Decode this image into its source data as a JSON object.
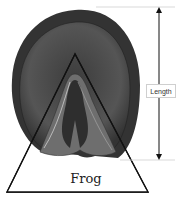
{
  "diagram": {
    "labels": {
      "length": "Length",
      "frog": "Frog"
    },
    "colors": {
      "hoof_dark": "#3a3a3a",
      "hoof_mid": "#5a5a5a",
      "frog_grey": "#7a7a7a",
      "lines": "#111111"
    }
  }
}
